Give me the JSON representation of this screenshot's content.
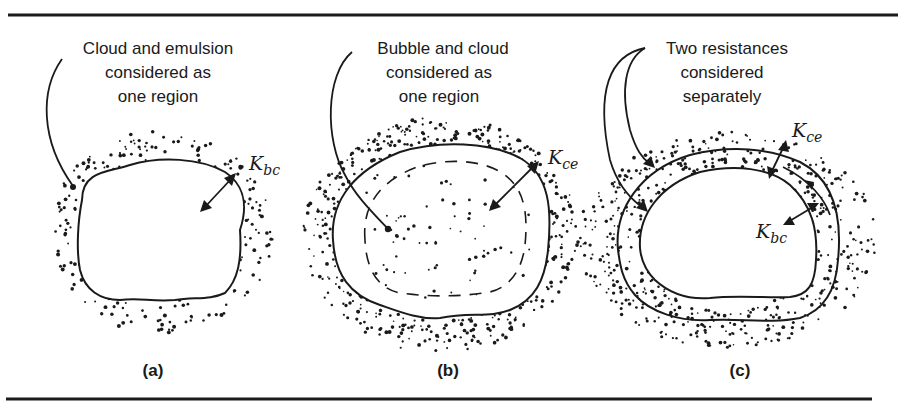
{
  "figure": {
    "panels": [
      {
        "id": "a",
        "label": "(a)",
        "caption_lines": [
          "Cloud and emulsion",
          "considered as",
          "one region"
        ],
        "coefficients": [
          {
            "symbol": "K",
            "subscript": "bc"
          }
        ]
      },
      {
        "id": "b",
        "label": "(b)",
        "caption_lines": [
          "Bubble and cloud",
          "considered as",
          "one region"
        ],
        "coefficients": [
          {
            "symbol": "K",
            "subscript": "ce"
          }
        ]
      },
      {
        "id": "c",
        "label": "(c)",
        "caption_lines": [
          "Two resistances",
          "considered",
          "separately"
        ],
        "coefficients": [
          {
            "symbol": "K",
            "subscript": "ce"
          },
          {
            "symbol": "K",
            "subscript": "bc"
          }
        ]
      }
    ],
    "colors": {
      "ink": "#1a1a1a",
      "background": "#ffffff"
    }
  }
}
